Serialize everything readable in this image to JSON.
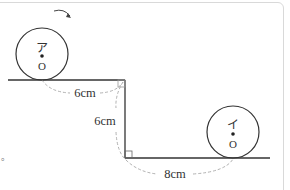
{
  "diagram": {
    "circle_a": {
      "label": "ア",
      "center_label": "O"
    },
    "circle_b": {
      "label": "イ",
      "center_label": "O"
    },
    "dimensions": {
      "top_horizontal": "6cm",
      "vertical": "6cm",
      "bottom_horizontal": "8cm"
    },
    "rotation_arrow": "clockwise-arrow",
    "stray_mark": "。",
    "colors": {
      "line": "#333333",
      "dashed_arc": "#a8a8a8",
      "frame_border": "#d9d9d9"
    }
  }
}
